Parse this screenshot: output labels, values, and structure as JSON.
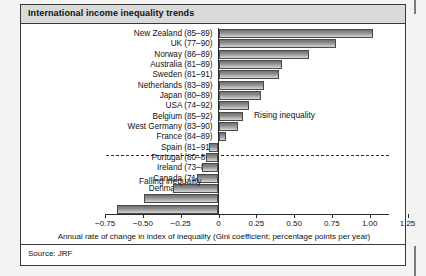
{
  "figure": {
    "title": "International income inequality trends",
    "source": "Source: JRF"
  },
  "annotations": {
    "rising": "Rising inequality",
    "falling": "Falling inequality"
  },
  "chart_data": {
    "type": "bar",
    "orientation": "horizontal",
    "title": "International income inequality trends",
    "xlabel": "Annual rate of change in index of inequality (Gini coefficient; percentage points per year)",
    "ylabel": "",
    "xlim": [
      -0.875,
      1.375
    ],
    "grid": false,
    "legend": "none",
    "zero_line": 0,
    "dashed_reference_line": "boundary between rising and falling inequality (between France and Spain)",
    "tick_values": [
      -0.75,
      -0.5,
      -0.25,
      0,
      0.25,
      0.5,
      0.75,
      1.0,
      1.25
    ],
    "tick_labels": [
      "−0.75",
      "−0.50",
      "−0.25",
      "0",
      "0.25",
      "0.50",
      "0.75",
      "1.00",
      "1.25"
    ],
    "categories": [
      "New Zealand (85–89)",
      "UK (77–90)",
      "Norway (86–89)",
      "Australia (81–89)",
      "Sweden (81–91)",
      "Netherlands (83–89)",
      "Japan (80–89)",
      "USA (74–92)",
      "Belgium (85–92)",
      "West Germany (83–90)",
      "France (84–89)",
      "Spain (81–91)",
      "Portugal (80–89)",
      "Ireland (73–87)",
      "Canada (71–83)",
      "Denmark (81–87)",
      "Finland (71–85)",
      "Italy (87–91)"
    ],
    "values": [
      1.02,
      0.78,
      0.6,
      0.42,
      0.4,
      0.3,
      0.28,
      0.2,
      0.16,
      0.13,
      0.05,
      -0.06,
      -0.08,
      -0.11,
      -0.14,
      -0.3,
      -0.49,
      -0.67
    ]
  }
}
